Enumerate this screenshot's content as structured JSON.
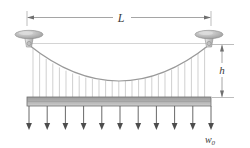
{
  "figure": {
    "background_color": "#ffffff",
    "labels": {
      "span_label": "L",
      "sag_label": "h",
      "load_label": "w",
      "load_subscript": "0"
    },
    "colors": {
      "cable": "#9a9a9a",
      "hanger": "#b8b8b8",
      "deck_fill_top": "#a8a8a8",
      "deck_fill_bottom": "#c9c9c9",
      "deck_outline": "#6e6e6e",
      "arrow": "#575757",
      "dimension_line": "#8e8e8e",
      "tower_cap": "#b0b0b0",
      "tower_body": "#d2d2d2",
      "reference_line": "#bdbdbd",
      "text": "#3a3a3a"
    },
    "geometry": {
      "span_left_x": 27,
      "span_right_x": 211,
      "dimension_y": 17,
      "tower_top_y": 34,
      "cable_anchor_y": 45,
      "cable_sag_y": 81,
      "deck_top_y": 97,
      "deck_bottom_y": 106,
      "arrow_tip_y": 130,
      "sag_dimension_x": 222,
      "hanger_count": 27,
      "load_arrow_count": 11
    }
  },
  "elements": {
    "span_dimension_name": "Span length L",
    "sag_dimension_name": "Sag h",
    "deck_name": "Bridge deck",
    "cable_name": "Parabolic main cable",
    "load_name": "Uniform distributed load w0",
    "left_tower_name": "Left tower",
    "right_tower_name": "Right tower"
  }
}
